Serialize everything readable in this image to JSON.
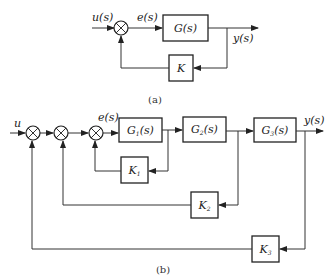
{
  "diagram_a": {
    "caption": "(a)",
    "input_label": "u(s)",
    "error_label": "e(s)",
    "output_label": "y(s)",
    "forward_block": "G(s)",
    "feedback_block": "K"
  },
  "diagram_b": {
    "caption": "(b)",
    "input_label": "u",
    "error_label": "e(s)",
    "output_label": "y(s)",
    "forward_blocks": [
      {
        "name": "G",
        "sub": "1",
        "arg": "(s)"
      },
      {
        "name": "G",
        "sub": "2",
        "arg": "(s)"
      },
      {
        "name": "G",
        "sub": "3",
        "arg": "(s)"
      }
    ],
    "feedback_blocks": [
      {
        "name": "K",
        "sub": "1"
      },
      {
        "name": "K",
        "sub": "2"
      },
      {
        "name": "K",
        "sub": "3"
      }
    ]
  }
}
